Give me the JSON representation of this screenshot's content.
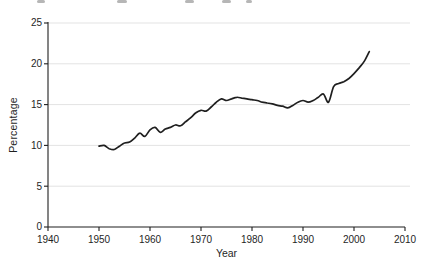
{
  "figure": {
    "background": "#ffffff",
    "line_color": "#1f1f1f",
    "grid_color": "#e3e3e3",
    "axis_color": "#1f1f1f",
    "text_color": "#1f1f1f",
    "caption_fragment_color": "#8f8f8f"
  },
  "chart_data": {
    "type": "line",
    "title": "",
    "xlabel": "Year",
    "ylabel": "Percentage",
    "xlim": [
      1940,
      2010
    ],
    "ylim": [
      0,
      25
    ],
    "x_ticks": [
      1940,
      1950,
      1960,
      1970,
      1980,
      1990,
      2000,
      2010
    ],
    "y_ticks": [
      0,
      5,
      10,
      15,
      20,
      25
    ],
    "grid": "horizontal",
    "legend": "none",
    "series": [
      {
        "name": "percentage",
        "x": [
          1950,
          1951,
          1952,
          1953,
          1954,
          1955,
          1956,
          1957,
          1958,
          1959,
          1960,
          1961,
          1962,
          1963,
          1964,
          1965,
          1966,
          1967,
          1968,
          1969,
          1970,
          1971,
          1972,
          1973,
          1974,
          1975,
          1976,
          1977,
          1978,
          1979,
          1980,
          1981,
          1982,
          1983,
          1984,
          1985,
          1986,
          1987,
          1988,
          1989,
          1990,
          1991,
          1992,
          1993,
          1994,
          1995,
          1996,
          1997,
          1998,
          1999,
          2000,
          2001,
          2002,
          2003
        ],
        "values": [
          9.9,
          10.0,
          9.6,
          9.5,
          9.9,
          10.3,
          10.4,
          10.9,
          11.5,
          11.1,
          11.9,
          12.2,
          11.6,
          12.0,
          12.2,
          12.5,
          12.4,
          12.9,
          13.4,
          14.0,
          14.3,
          14.2,
          14.7,
          15.3,
          15.7,
          15.5,
          15.7,
          15.9,
          15.8,
          15.7,
          15.6,
          15.5,
          15.3,
          15.2,
          15.1,
          14.9,
          14.8,
          14.6,
          14.9,
          15.3,
          15.5,
          15.3,
          15.5,
          15.9,
          16.3,
          15.3,
          17.2,
          17.6,
          17.8,
          18.2,
          18.8,
          19.5,
          20.3,
          21.5
        ]
      }
    ]
  }
}
